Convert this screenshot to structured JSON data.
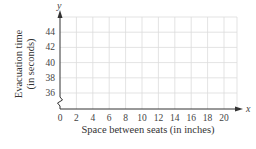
{
  "chart_data": {
    "type": "scatter",
    "title": "",
    "xlabel": "Space between seats (in inches)",
    "ylabel_line1": "Evacuation time",
    "ylabel_line2": "(in seconds)",
    "x_axis_var": "x",
    "y_axis_var": "y",
    "x_ticks": [
      "0",
      "2",
      "4",
      "6",
      "8",
      "10",
      "12",
      "14",
      "16",
      "18",
      "20"
    ],
    "y_ticks": [
      "36",
      "38",
      "40",
      "42",
      "44"
    ],
    "xlim": [
      0,
      21.5
    ],
    "ylim": [
      35,
      46
    ],
    "y_axis_break": true,
    "grid": true,
    "x": [],
    "y": [],
    "legend": []
  },
  "colors": {
    "grid": "#dcdcdc",
    "axis": "#333333",
    "text": "#444444"
  }
}
